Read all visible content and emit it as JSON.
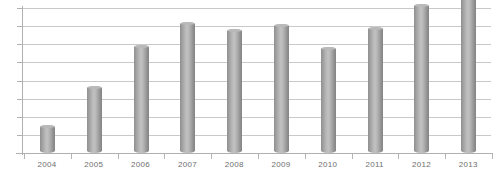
{
  "chart_data": {
    "type": "bar",
    "title": "",
    "subtitle": "",
    "xlabel": "",
    "ylabel": "",
    "categories": [
      "2004",
      "2005",
      "2006",
      "2007",
      "2008",
      "2009",
      "2010",
      "2011",
      "2012",
      "2013"
    ],
    "values": [
      1.6,
      3.8,
      6.1,
      7.4,
      7.0,
      7.25,
      6.0,
      7.1,
      8.4,
      8.9
    ],
    "series": [
      {
        "name": "",
        "values": [
          1.6,
          3.8,
          6.1,
          7.4,
          7.0,
          7.25,
          6.0,
          7.1,
          8.4,
          8.9
        ]
      }
    ],
    "ylim": [
      0,
      9.2
    ],
    "ytick_labels": [],
    "gridlines": 9,
    "grid": true,
    "legend": false,
    "legend_position": "none",
    "annotations": [],
    "colors": {
      "bar_light": "#c2c2c2",
      "bar_mid": "#a8a8a8",
      "bar_dark": "#858585",
      "gridline": "#c9c9c9",
      "axis": "#b0b0b0",
      "label_text": "#6e6e6e",
      "background": "#ffffff"
    }
  },
  "axis": {
    "x_labels": [
      "2004",
      "2005",
      "2006",
      "2007",
      "2008",
      "2009",
      "2010",
      "2011",
      "2012",
      "2013"
    ]
  }
}
